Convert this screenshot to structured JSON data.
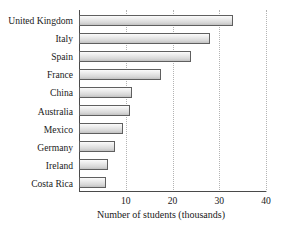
{
  "chart_data": {
    "type": "bar",
    "orientation": "horizontal",
    "title": "",
    "xlabel": "Number of students (thousands)",
    "ylabel": "",
    "categories": [
      "United Kingdom",
      "Italy",
      "Spain",
      "France",
      "China",
      "Australia",
      "Mexico",
      "Germany",
      "Ireland",
      "Costa Rica"
    ],
    "values": [
      33,
      28,
      24,
      17.5,
      11.3,
      11,
      9.5,
      7.7,
      6.2,
      5.8
    ],
    "xlim": [
      0,
      40
    ],
    "xticks": [
      10,
      20,
      30,
      40
    ],
    "xtick_labels": [
      "10",
      "20",
      "30",
      "40"
    ],
    "grid": "vertical-dotted",
    "legend": "none",
    "bar_edge_color": "#5f5f5f",
    "bar_fill_color": "#e0e0e0",
    "axis_color": "#4a4a4a",
    "gridline_color": "#b4b4b4"
  },
  "partial_title": "",
  "axis": {
    "x_label": "Number of students (thousands)"
  }
}
